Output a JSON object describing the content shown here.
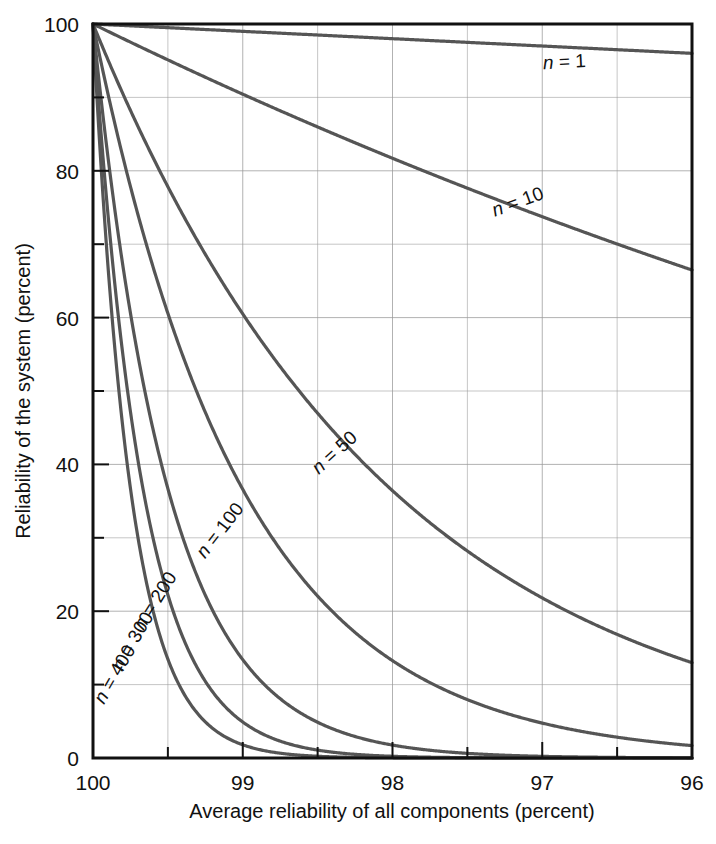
{
  "chart_data": {
    "type": "line",
    "title": "",
    "xlabel": "Average reliability of all components (percent)",
    "ylabel": "Reliability of the system (percent)",
    "xlim": [
      100,
      96
    ],
    "ylim": [
      0,
      100
    ],
    "x_tick_labels": [
      "100",
      "99",
      "98",
      "97",
      "96"
    ],
    "x_ticks": [
      100,
      99,
      98,
      97,
      96
    ],
    "x_minor_step": 0.5,
    "y_tick_labels": [
      "0",
      "20",
      "40",
      "60",
      "80",
      "100"
    ],
    "y_ticks": [
      0,
      20,
      40,
      60,
      80,
      100
    ],
    "y_minor_step": 10,
    "grid": true,
    "grid_color": "#999999",
    "curve_color": "#555555",
    "axis_color": "#111111",
    "legend": "inline-labels",
    "x": [
      100,
      99.75,
      99.5,
      99.25,
      99,
      98.75,
      98.5,
      98.25,
      98,
      97.75,
      97.5,
      97.25,
      97,
      96.75,
      96.5,
      96.25,
      96
    ],
    "series": [
      {
        "name": "n = 1",
        "n": 1,
        "label": "n = 1",
        "values": [
          100,
          99.75,
          99.5,
          99.25,
          99,
          98.75,
          98.5,
          98.25,
          98,
          97.75,
          97.5,
          97.25,
          97,
          96.75,
          96.5,
          96.25,
          96
        ]
      },
      {
        "name": "n = 10",
        "n": 10,
        "label": "n = 10",
        "values": [
          100,
          97.53,
          95.11,
          92.75,
          90.44,
          88.18,
          85.97,
          83.81,
          81.71,
          79.65,
          77.63,
          75.67,
          73.74,
          71.87,
          70.03,
          68.24,
          66.48
        ]
      },
      {
        "name": "n = 50",
        "n": 50,
        "label": "n = 50",
        "values": [
          100,
          88.22,
          77.83,
          68.64,
          60.5,
          53.32,
          46.97,
          41.35,
          36.42,
          32.05,
          28.21,
          24.82,
          21.83,
          19.2,
          16.88,
          14.84,
          13.04
        ]
      },
      {
        "name": "n = 100",
        "n": 100,
        "label": "n = 100",
        "values": [
          100,
          77.83,
          60.58,
          47.11,
          36.6,
          28.43,
          22.06,
          17.1,
          13.26,
          10.27,
          7.96,
          6.16,
          4.76,
          3.69,
          2.85,
          2.2,
          1.7
        ]
      },
      {
        "name": "n = 200",
        "n": 200,
        "label": "n = 200",
        "values": [
          100,
          60.58,
          36.7,
          22.19,
          13.4,
          8.08,
          4.87,
          2.92,
          1.76,
          1.05,
          0.63,
          0.38,
          0.23,
          0.14,
          0.08,
          0.05,
          0.03
        ]
      },
      {
        "name": "n = 300",
        "n": 300,
        "label": "n = 300",
        "values": [
          100,
          47.15,
          22.23,
          10.45,
          4.9,
          2.3,
          1.07,
          0.5,
          0.23,
          0.11,
          0.05,
          0.02,
          0.01,
          0.005,
          0.002,
          0.001,
          0.0005
        ]
      },
      {
        "name": "n = 400",
        "n": 400,
        "label": "n = 400",
        "values": [
          100,
          36.7,
          13.47,
          4.92,
          1.8,
          0.65,
          0.24,
          0.09,
          0.03,
          0.01,
          0.004,
          0.001,
          0.0005,
          0.0002,
          0.0001,
          3e-05,
          1e-05
        ]
      }
    ],
    "annotations": [
      {
        "text": "n = 1",
        "x": 96.85,
        "y": 94.0,
        "rotation": -3
      },
      {
        "text": "n = 10",
        "x": 97.15,
        "y": 75.0,
        "rotation": -20
      },
      {
        "text": "n = 50",
        "x": 98.36,
        "y": 41.0,
        "rotation": -42
      },
      {
        "text": "n = 100",
        "x": 99.12,
        "y": 30.5,
        "rotation": -52
      },
      {
        "text": "n = 200",
        "x": 99.55,
        "y": 21.0,
        "rotation": -58
      },
      {
        "text": "n = 300",
        "x": 99.7,
        "y": 15.5,
        "rotation": -60
      },
      {
        "text": "n = 400",
        "x": 99.82,
        "y": 11.0,
        "rotation": -60
      }
    ]
  },
  "axes": {
    "y_labels": [
      "100",
      "80",
      "60",
      "40",
      "20",
      "0"
    ],
    "x_labels": [
      "100",
      "99",
      "98",
      "97",
      "96"
    ],
    "x_title": "Average reliability of all components (percent)",
    "y_title": "Reliability of the system (percent)"
  },
  "labels": {
    "n1": "n = 1",
    "n10": "n = 10",
    "n50": "n = 50",
    "n100": "n = 100",
    "n200": "n = 200",
    "n300": "n = 300",
    "n400": "n = 400"
  }
}
